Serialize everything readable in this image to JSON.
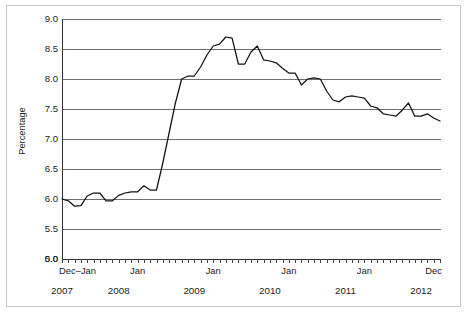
{
  "figure": {
    "background_color": "#ffffff",
    "frame_color": "#c8c8c8",
    "line_color": "#111111",
    "grid_color": "#6f6f6f"
  },
  "chart_data": {
    "type": "line",
    "title": "",
    "subtitle": "",
    "xlabel": "",
    "ylabel": "Percentage",
    "grid": "horizontal",
    "legend": "none",
    "ylim": [
      5.0,
      9.0
    ],
    "y_axis_broken": true,
    "y_break_note": "axis shows 0.0 at the baseline then resumes at 5.0",
    "yticks": [
      "0.0",
      "5.0",
      "5.5",
      "6.0",
      "6.5",
      "7.0",
      "7.5",
      "8.0",
      "8.5",
      "9.0"
    ],
    "ytick_values": [
      0.0,
      5.0,
      5.5,
      6.0,
      6.5,
      7.0,
      7.5,
      8.0,
      8.5,
      9.0
    ],
    "xtick_labels": [
      "Dec–Jan",
      "Jan",
      "Jan",
      "Jan",
      "Jan",
      "Dec"
    ],
    "xtick_label_positions": [
      0,
      12,
      24,
      36,
      48,
      60
    ],
    "year_labels": [
      "2007",
      "2008",
      "2009",
      "2010",
      "2011",
      "2012"
    ],
    "year_label_positions": [
      0,
      9,
      21,
      33,
      45,
      57
    ],
    "x_tick_count": 61,
    "x_tick_interval": "monthly",
    "x_start": "Dec 2007",
    "x_end": "Dec 2012",
    "series": [
      {
        "name": "Percentage",
        "x": [
          0,
          1,
          2,
          3,
          4,
          5,
          6,
          7,
          8,
          9,
          10,
          11,
          12,
          13,
          14,
          15,
          16,
          17,
          18,
          19,
          20,
          21,
          22,
          23,
          24,
          25,
          26,
          27,
          28,
          29,
          30,
          31,
          32,
          33,
          34,
          35,
          36,
          37,
          38,
          39,
          40,
          41,
          42,
          43,
          44,
          45,
          46,
          47,
          48,
          49,
          50,
          51,
          52,
          53,
          54,
          55,
          56,
          57,
          58,
          59,
          60
        ],
        "values": [
          6.0,
          5.97,
          5.88,
          5.89,
          6.05,
          6.1,
          6.1,
          5.97,
          5.97,
          6.06,
          6.1,
          6.12,
          6.12,
          6.22,
          6.15,
          6.15,
          6.6,
          7.1,
          7.6,
          8.0,
          8.05,
          8.05,
          8.2,
          8.4,
          8.55,
          8.58,
          8.7,
          8.68,
          8.25,
          8.25,
          8.45,
          8.55,
          8.32,
          8.3,
          8.27,
          8.18,
          8.1,
          8.1,
          7.9,
          8.0,
          8.02,
          8.0,
          7.8,
          7.65,
          7.62,
          7.7,
          7.72,
          7.7,
          7.68,
          7.55,
          7.52,
          7.42,
          7.4,
          7.38,
          7.48,
          7.6,
          7.38,
          7.38,
          7.42,
          7.35,
          7.3
        ]
      }
    ]
  }
}
